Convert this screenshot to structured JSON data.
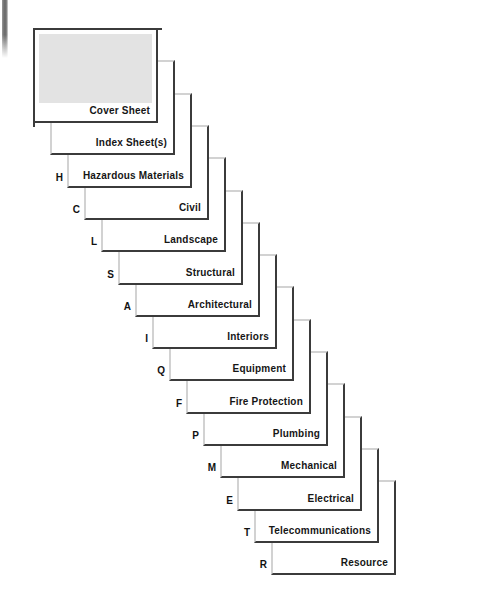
{
  "diagram": {
    "background_color": "#ffffff",
    "sheet_border_color": "#3b3b3b",
    "sheet_fill_color": "#ffffff",
    "cover_fill_color": "#e3e3e3",
    "label_color": "#161616",
    "step_x": 17,
    "step_y": 32.3,
    "sheet_width": 125,
    "sheet_height": 95,
    "origin_x": 33,
    "origin_y": 28,
    "sheets": [
      {
        "label": "Cover Sheet",
        "letter": "",
        "cover": true
      },
      {
        "label": "Index Sheet(s)",
        "letter": "",
        "cover": false
      },
      {
        "label": "Hazardous Materials",
        "letter": "H",
        "cover": false
      },
      {
        "label": "Civil",
        "letter": "C",
        "cover": false
      },
      {
        "label": "Landscape",
        "letter": "L",
        "cover": false
      },
      {
        "label": "Structural",
        "letter": "S",
        "cover": false
      },
      {
        "label": "Architectural",
        "letter": "A",
        "cover": false
      },
      {
        "label": "Interiors",
        "letter": "I",
        "cover": false
      },
      {
        "label": "Equipment",
        "letter": "Q",
        "cover": false
      },
      {
        "label": "Fire Protection",
        "letter": "F",
        "cover": false
      },
      {
        "label": "Plumbing",
        "letter": "P",
        "cover": false
      },
      {
        "label": "Mechanical",
        "letter": "M",
        "cover": false
      },
      {
        "label": "Electrical",
        "letter": "E",
        "cover": false
      },
      {
        "label": "Telecommunications",
        "letter": "T",
        "cover": false
      },
      {
        "label": "Resource",
        "letter": "R",
        "cover": false
      }
    ]
  }
}
